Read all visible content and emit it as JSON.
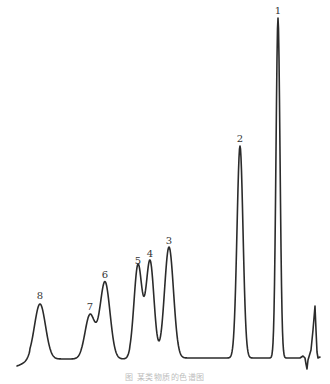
{
  "chart_data": {
    "type": "line",
    "title": "",
    "caption": "图  某类物质的色谱图",
    "xlabel": "",
    "ylabel": "",
    "grid": false,
    "legend": "none",
    "line_color": "#2b2b2b",
    "peaks": [
      {
        "label": "1",
        "x": 278,
        "top_y": 18,
        "width": 2.0,
        "label_y": 6
      },
      {
        "label": "2",
        "x": 240,
        "top_y": 146,
        "width": 3.0,
        "label_y": 134
      },
      {
        "label": "3",
        "x": 169,
        "top_y": 247,
        "width": 4.5,
        "label_y": 236
      },
      {
        "label": "4",
        "x": 150,
        "top_y": 261,
        "width": 4.0,
        "label_y": 249
      },
      {
        "label": "5",
        "x": 138,
        "top_y": 265,
        "width": 4.0,
        "label_y": 256
      },
      {
        "label": "6",
        "x": 105,
        "top_y": 282,
        "width": 5.0,
        "label_y": 270
      },
      {
        "label": "7",
        "x": 90,
        "top_y": 315,
        "width": 5.0,
        "label_y": 302
      },
      {
        "label": "8",
        "x": 40,
        "top_y": 304,
        "width": 5.5,
        "label_y": 291
      }
    ],
    "relative_heights": {
      "1": 100,
      "2": 62,
      "3": 33,
      "4": 29,
      "5": 28,
      "6": 23,
      "7": 13,
      "8": 17
    },
    "baseline_y": 358
  }
}
